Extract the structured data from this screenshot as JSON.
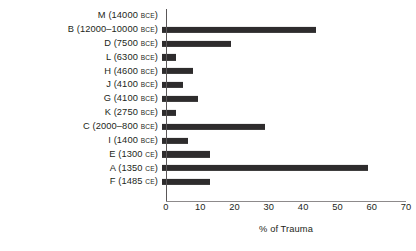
{
  "chart_data": {
    "type": "bar",
    "orientation": "horizontal",
    "title": "",
    "xlabel": "% of Trauma",
    "ylabel": "",
    "xlim": [
      0,
      70
    ],
    "xticks": [
      0,
      10,
      20,
      30,
      40,
      50,
      60,
      70
    ],
    "grid": false,
    "legend": null,
    "bar_color": "#2e2c2d",
    "axis_color": "#8d8a8b",
    "categories": [
      "M (14000 BCE)",
      "B (12000–10000 BCE)",
      "D (7500 BCE)",
      "L (6300 BCE)",
      "H (4600 BCE)",
      "J (4100 BCE)",
      "G (4100 BCE)",
      "K (2750 BCE)",
      "C (2000–800 BCE)",
      "I (1400 BCE)",
      "E (1300 CE)",
      "A (1350 CE)",
      "F (1485 CE)"
    ],
    "values": [
      0,
      45,
      20,
      4,
      9,
      6,
      10.5,
      4,
      30,
      7.5,
      14,
      60,
      14
    ],
    "rows": [
      {
        "code": "M",
        "date": "14000",
        "era": "BCE",
        "label_main": "M  (14000",
        "label_era": "BCE",
        "label_tail": ")",
        "value": 0
      },
      {
        "code": "B",
        "date": "12000–10000",
        "era": "BCE",
        "label_main": "B  (12000–10000",
        "label_era": "BCE",
        "label_tail": ")",
        "value": 45
      },
      {
        "code": "D",
        "date": "7500",
        "era": "BCE",
        "label_main": "D  (7500",
        "label_era": "BCE",
        "label_tail": ")",
        "value": 20
      },
      {
        "code": "L",
        "date": "6300",
        "era": "BCE",
        "label_main": "L  (6300",
        "label_era": "BCE",
        "label_tail": ")",
        "value": 4
      },
      {
        "code": "H",
        "date": "4600",
        "era": "BCE",
        "label_main": "H  (4600",
        "label_era": "BCE",
        "label_tail": ")",
        "value": 9
      },
      {
        "code": "J",
        "date": "4100",
        "era": "BCE",
        "label_main": "J  (4100",
        "label_era": "BCE",
        "label_tail": ")",
        "value": 6
      },
      {
        "code": "G",
        "date": "4100",
        "era": "BCE",
        "label_main": "G  (4100",
        "label_era": "BCE",
        "label_tail": ")",
        "value": 10.5
      },
      {
        "code": "K",
        "date": "2750",
        "era": "BCE",
        "label_main": "K  (2750",
        "label_era": "BCE",
        "label_tail": ")",
        "value": 4
      },
      {
        "code": "C",
        "date": "2000–800",
        "era": "BCE",
        "label_main": "C  (2000–800",
        "label_era": "BCE",
        "label_tail": ")",
        "value": 30
      },
      {
        "code": "I",
        "date": "1400",
        "era": "BCE",
        "label_main": "I  (1400",
        "label_era": "BCE",
        "label_tail": ")",
        "value": 7.5
      },
      {
        "code": "E",
        "date": "1300",
        "era": "CE",
        "label_main": "E  (1300",
        "label_era": "CE",
        "label_tail": ")",
        "value": 14
      },
      {
        "code": "A",
        "date": "1350",
        "era": "CE",
        "label_main": "A  (1350",
        "label_era": "CE",
        "label_tail": ")",
        "value": 60
      },
      {
        "code": "F",
        "date": "1485",
        "era": "CE",
        "label_main": "F  (1485",
        "label_era": "CE",
        "label_tail": ")",
        "value": 14
      }
    ]
  }
}
